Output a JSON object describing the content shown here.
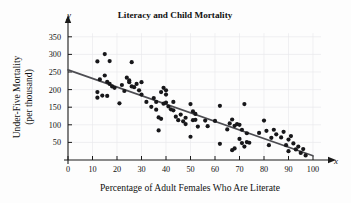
{
  "chart_data": {
    "type": "scatter",
    "title": "Literacy and Child Mortality",
    "xlabel": "Percentage of Adult Females Who Are Literate",
    "ylabel": "Under-Five Mortality\n(per thousand)",
    "ylabel_line1": "Under-Five Mortality",
    "ylabel_line2": "(per thousand)",
    "x_axis_name": "x",
    "y_axis_name": "y",
    "xlim": [
      0,
      100
    ],
    "ylim": [
      0,
      375
    ],
    "xticks": [
      0,
      10,
      20,
      30,
      40,
      50,
      60,
      70,
      80,
      90,
      100
    ],
    "xtick_labels": [
      "0",
      "10",
      "20",
      "30",
      "40",
      "50",
      "60",
      "70",
      "80",
      "90",
      "100"
    ],
    "yticks": [
      50,
      100,
      150,
      200,
      250,
      300,
      350
    ],
    "ytick_labels": [
      "50",
      "100",
      "150",
      "200",
      "250",
      "300",
      "350"
    ],
    "grid": true,
    "grid_color": "#e9e9ec",
    "point_color": "#17171a",
    "trend_color": "#4d4d52",
    "trendline": {
      "type": "linear-fit",
      "x_start": 0,
      "y_start": 256,
      "x_end": 100,
      "y_end": 12
    },
    "points": [
      [
        12,
        280
      ],
      [
        12,
        193
      ],
      [
        12,
        177
      ],
      [
        13,
        229
      ],
      [
        14,
        183
      ],
      [
        15,
        240
      ],
      [
        15,
        301
      ],
      [
        16,
        222
      ],
      [
        16,
        182
      ],
      [
        17,
        216
      ],
      [
        17,
        281
      ],
      [
        18,
        209
      ],
      [
        19,
        205
      ],
      [
        21,
        161
      ],
      [
        22,
        213
      ],
      [
        23,
        196
      ],
      [
        24,
        234
      ],
      [
        25,
        226
      ],
      [
        25,
        221
      ],
      [
        26,
        278
      ],
      [
        26,
        209
      ],
      [
        27,
        207
      ],
      [
        28,
        216
      ],
      [
        29,
        198
      ],
      [
        30,
        221
      ],
      [
        30,
        186
      ],
      [
        32,
        165
      ],
      [
        34,
        151
      ],
      [
        35,
        176
      ],
      [
        36,
        143
      ],
      [
        36,
        165
      ],
      [
        37,
        121
      ],
      [
        37,
        84
      ],
      [
        38,
        193
      ],
      [
        38,
        117
      ],
      [
        39,
        205
      ],
      [
        39,
        160
      ],
      [
        40,
        198
      ],
      [
        40,
        186
      ],
      [
        40,
        163
      ],
      [
        41,
        152
      ],
      [
        42,
        144
      ],
      [
        43,
        165
      ],
      [
        43,
        141
      ],
      [
        44,
        123
      ],
      [
        45,
        113
      ],
      [
        46,
        129
      ],
      [
        47,
        110
      ],
      [
        48,
        120
      ],
      [
        48,
        102
      ],
      [
        50,
        159
      ],
      [
        50,
        66
      ],
      [
        51,
        113
      ],
      [
        51,
        138
      ],
      [
        52,
        131
      ],
      [
        52,
        114
      ],
      [
        53,
        95
      ],
      [
        56,
        112
      ],
      [
        57,
        96
      ],
      [
        60,
        111
      ],
      [
        62,
        154
      ],
      [
        62,
        46
      ],
      [
        65,
        87
      ],
      [
        66,
        104
      ],
      [
        67,
        28
      ],
      [
        67,
        115
      ],
      [
        68,
        97
      ],
      [
        68,
        33
      ],
      [
        69,
        102
      ],
      [
        70,
        100
      ],
      [
        70,
        60
      ],
      [
        71,
        48
      ],
      [
        71,
        86
      ],
      [
        72,
        159
      ],
      [
        72,
        38
      ],
      [
        73,
        51
      ],
      [
        73,
        76
      ],
      [
        74,
        49
      ],
      [
        78,
        77
      ],
      [
        80,
        112
      ],
      [
        81,
        83
      ],
      [
        82,
        42
      ],
      [
        83,
        63
      ],
      [
        84,
        86
      ],
      [
        85,
        73
      ],
      [
        87,
        64
      ],
      [
        88,
        80
      ],
      [
        89,
        42
      ],
      [
        90,
        58
      ],
      [
        90,
        25
      ],
      [
        91,
        68
      ],
      [
        92,
        47
      ],
      [
        93,
        30
      ],
      [
        94,
        38
      ],
      [
        95,
        20
      ],
      [
        96,
        31
      ],
      [
        97,
        13
      ]
    ]
  }
}
